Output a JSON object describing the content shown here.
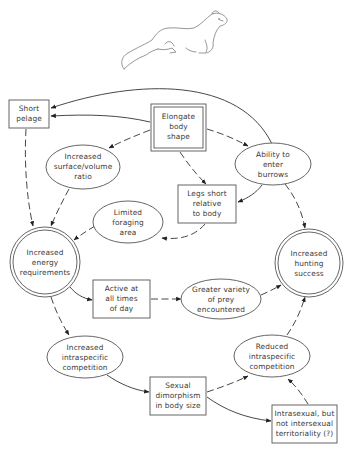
{
  "diagram": {
    "illustration": "weasel",
    "nodes": {
      "short_pelage": {
        "shape": "box",
        "lines": [
          "Short",
          "pelage"
        ]
      },
      "elongate_body": {
        "shape": "double-box",
        "lines": [
          "Elongate",
          "body",
          "shape"
        ]
      },
      "surface_volume": {
        "shape": "ellipse",
        "lines": [
          "Increased",
          "surface/volume",
          "ratio"
        ]
      },
      "enter_burrows": {
        "shape": "ellipse",
        "lines": [
          "Ability to",
          "enter",
          "burrows"
        ]
      },
      "legs_short": {
        "shape": "box",
        "lines": [
          "Legs short",
          "relative",
          "to body"
        ]
      },
      "limited_foraging": {
        "shape": "ellipse",
        "lines": [
          "Limited",
          "foraging",
          "area"
        ]
      },
      "energy_requirements": {
        "shape": "double-circle",
        "lines": [
          "Increased",
          "energy",
          "requirements"
        ]
      },
      "hunting_success": {
        "shape": "double-circle",
        "lines": [
          "Increased",
          "hunting",
          "success"
        ]
      },
      "active_all_times": {
        "shape": "box",
        "lines": [
          "Active at",
          "all times",
          "of day"
        ]
      },
      "greater_variety": {
        "shape": "ellipse",
        "lines": [
          "Greater variety",
          "of prey",
          "encountered"
        ]
      },
      "increased_competition": {
        "shape": "ellipse",
        "lines": [
          "Increased",
          "intraspecific",
          "competition"
        ]
      },
      "reduced_competition": {
        "shape": "ellipse",
        "lines": [
          "Reduced",
          "intraspecific",
          "competition"
        ]
      },
      "sexual_dimorphism": {
        "shape": "box",
        "lines": [
          "Sexual",
          "dimorphism",
          "in body size"
        ]
      },
      "territoriality": {
        "shape": "box",
        "lines": [
          "Intrasexual, but",
          "not intersexual",
          "territoriality (?)"
        ]
      }
    },
    "edges": [
      {
        "from": "enter_burrows",
        "to": "short_pelage",
        "style": "solid"
      },
      {
        "from": "elongate_body",
        "to": "short_pelage",
        "style": "solid"
      },
      {
        "from": "elongate_body",
        "to": "surface_volume",
        "style": "dashed"
      },
      {
        "from": "elongate_body",
        "to": "enter_burrows",
        "style": "dashed"
      },
      {
        "from": "elongate_body",
        "to": "legs_short",
        "style": "dashed"
      },
      {
        "from": "enter_burrows",
        "to": "legs_short",
        "style": "solid"
      },
      {
        "from": "enter_burrows",
        "to": "hunting_success",
        "style": "dashed"
      },
      {
        "from": "short_pelage",
        "to": "energy_requirements",
        "style": "dashed"
      },
      {
        "from": "surface_volume",
        "to": "energy_requirements",
        "style": "dashed"
      },
      {
        "from": "legs_short",
        "to": "limited_foraging",
        "style": "dashed"
      },
      {
        "from": "limited_foraging",
        "to": "energy_requirements",
        "style": "dashed"
      },
      {
        "from": "energy_requirements",
        "to": "active_all_times",
        "style": "solid"
      },
      {
        "from": "active_all_times",
        "to": "greater_variety",
        "style": "dashed"
      },
      {
        "from": "greater_variety",
        "to": "hunting_success",
        "style": "dashed"
      },
      {
        "from": "energy_requirements",
        "to": "increased_competition",
        "style": "dashed"
      },
      {
        "from": "increased_competition",
        "to": "sexual_dimorphism",
        "style": "solid"
      },
      {
        "from": "sexual_dimorphism",
        "to": "reduced_competition",
        "style": "dashed"
      },
      {
        "from": "sexual_dimorphism",
        "to": "territoriality",
        "style": "solid"
      },
      {
        "from": "territoriality",
        "to": "reduced_competition",
        "style": "dashed"
      },
      {
        "from": "reduced_competition",
        "to": "hunting_success",
        "style": "dashed"
      }
    ]
  }
}
